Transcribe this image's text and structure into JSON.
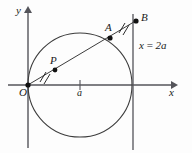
{
  "figure": {
    "background_color": "#fdfdfd",
    "stroke_color": "#3c3c3c",
    "axis_color": "#4a4a4a",
    "point_color": "#1a1a1a"
  },
  "axes": {
    "x_label": "x",
    "y_label": "y",
    "origin_label": "O",
    "x_tick_label": "a"
  },
  "labels": {
    "point_a": "A",
    "point_b": "B",
    "point_p": "P",
    "line_equation": "x = 2a",
    "line_equation_lhs": "x",
    "line_equation_eq": "=",
    "line_equation_rhs": "2a"
  },
  "geometry": {
    "origin": {
      "x": 28,
      "y": 85
    },
    "circle": {
      "cx": 80,
      "cy": 85,
      "r": 52
    },
    "vertical_line": {
      "x": 133,
      "y_top": 14,
      "y_bottom": 150
    },
    "point_a": {
      "x": 110,
      "y": 38
    },
    "point_b": {
      "x": 136,
      "y": 21
    },
    "point_p": {
      "x": 55,
      "y": 70
    },
    "x_tick": {
      "x": 80,
      "y": 85
    },
    "secant_start": {
      "x": 26,
      "y": 86
    },
    "secant_end": {
      "x": 139,
      "y": 19
    },
    "x_axis": {
      "x1": 8,
      "x2": 176,
      "y": 85
    },
    "y_axis": {
      "x": 28,
      "y1": 8,
      "y2": 148
    },
    "tick_mark_1": {
      "x": 44,
      "y": 76
    },
    "tick_mark_2": {
      "x": 124,
      "y": 28
    }
  },
  "icons": {
    "x_axis_arrow": "arrow-right-icon",
    "y_axis_arrow": "arrow-up-icon",
    "congruence-tick": "double-tick-mark-icon"
  }
}
